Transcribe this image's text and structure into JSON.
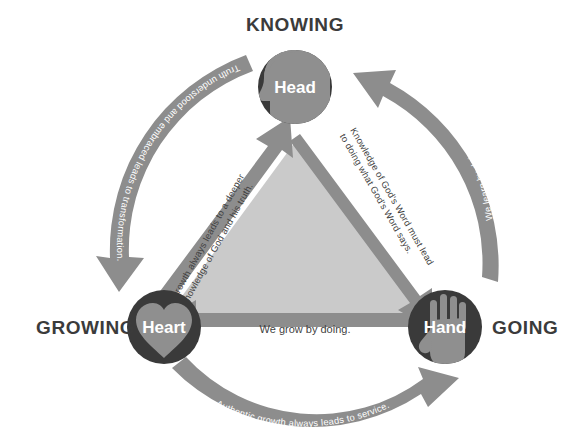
{
  "diagram": {
    "title_nodes": {
      "top": {
        "corner_label": "KNOWING",
        "node_label": "Head",
        "icon": "head-silhouette-icon"
      },
      "bottom_left": {
        "corner_label": "GROWING",
        "node_label": "Heart",
        "icon": "heart-icon"
      },
      "bottom_right": {
        "corner_label": "GOING",
        "node_label": "Hand",
        "icon": "hand-icon"
      }
    },
    "outer_arrows": [
      {
        "id": "head-to-heart",
        "text": "Truth understood and embraced leads to transformation."
      },
      {
        "id": "heart-to-hand",
        "text": "Authentic growth always leads to service."
      },
      {
        "id": "hand-to-head",
        "text": "We learn by doing."
      }
    ],
    "inner_arrows": [
      {
        "id": "head-to-hand",
        "text": "Knowledge of God's Word must lead to doing what God's Word says."
      },
      {
        "id": "hand-to-heart",
        "text": "We grow by doing."
      },
      {
        "id": "heart-to-head",
        "text": "Growth always leads to a deeper knowledge of God and his truth."
      }
    ],
    "colors": {
      "background": "#ffffff",
      "node_circle": "#3a3a3a",
      "node_icon": "#8f8f8f",
      "node_text": "#ffffff",
      "corner_label": "#3b3b3b",
      "outer_arrow": "#8d8d8d",
      "outer_arrow_text": "#ffffff",
      "inner_triangle": "#cacaca",
      "inner_arrow": "#8d8d8d",
      "inner_text": "#3f3f3f"
    }
  }
}
